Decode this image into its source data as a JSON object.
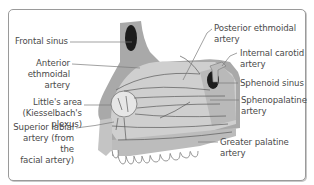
{
  "figure": {
    "colors": {
      "background": "#ffffff",
      "border": "#9a9a9a",
      "bone_dark": "#a9a9a9",
      "septum_light": "#cfcfcf",
      "septum_mid": "#bdbdbd",
      "sinus": "#1c1c1c",
      "vessel": "#5a5a5a",
      "leader_line": "#7a7a7a",
      "text": "#4a4a4a",
      "littles_area": "#e6e6e6"
    }
  },
  "labels": {
    "left": [
      {
        "id": "frontal-sinus",
        "text": "Frontal sinus"
      },
      {
        "id": "anterior-ethmoidal-artery",
        "text": "Anterior\nethmoidal\nartery"
      },
      {
        "id": "littles-area",
        "text": "Little's area\n(Kiesselbach's\nplexus)"
      },
      {
        "id": "superior-labial-artery",
        "text": "Superior labial\nartery (from the\nfacial artery)"
      }
    ],
    "right": [
      {
        "id": "posterior-ethmoidal-artery",
        "text": "Posterior ethmoidal\nartery"
      },
      {
        "id": "internal-carotid-artery",
        "text": "Internal carotid\nartery"
      },
      {
        "id": "sphenoid-sinus",
        "text": "Sphenoid sinus"
      },
      {
        "id": "sphenopalatine-artery",
        "text": "Sphenopalatine\nartery"
      },
      {
        "id": "greater-palatine-artery",
        "text": "Greater palatine\nartery"
      }
    ]
  }
}
